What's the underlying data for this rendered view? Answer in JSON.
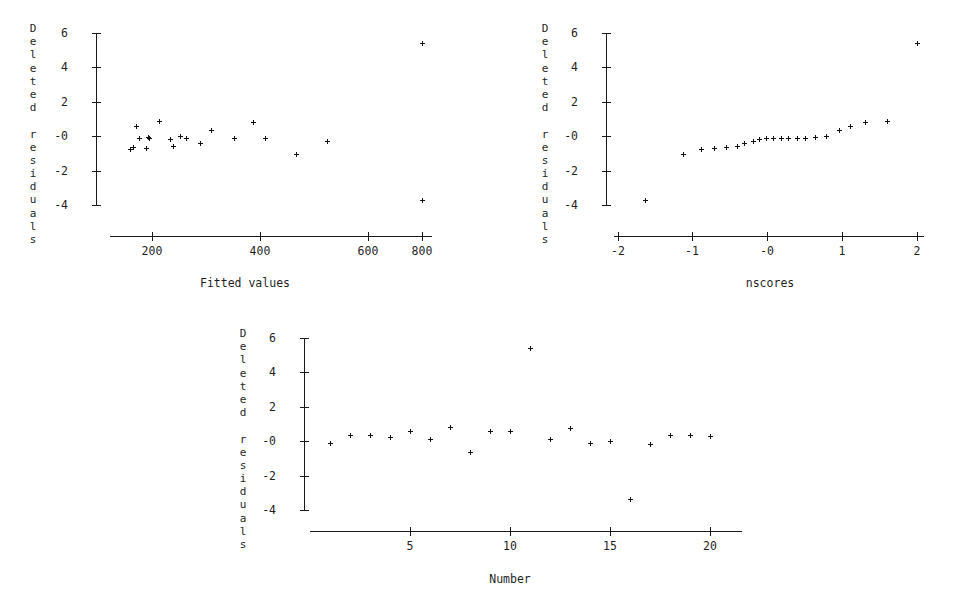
{
  "figure": {
    "y_axis_title": "Deleted residuals",
    "y_axis_title_chars": [
      "D",
      "e",
      "l",
      "e",
      "t",
      "e",
      "d",
      "",
      "r",
      "e",
      "s",
      "i",
      "d",
      "u",
      "a",
      "l",
      "s"
    ],
    "y_tick_labels": [
      "6",
      "4",
      "2",
      "-0",
      "-2",
      "-4"
    ],
    "y_tick_values": [
      6,
      4,
      2,
      0,
      -2,
      -4
    ],
    "marker": "point-marker",
    "n_observations": 20
  },
  "chart_data": [
    {
      "id": "residuals-vs-fitted",
      "type": "scatter",
      "title": "",
      "xlabel": "Fitted values",
      "ylabel": "Deleted residuals",
      "xlim": [
        130,
        830
      ],
      "ylim": [
        -4.6,
        6.4
      ],
      "xticks": [
        200,
        400,
        600,
        800
      ],
      "xtick_labels": [
        "200",
        "400",
        "600",
        "800"
      ],
      "yticks": [
        6,
        4,
        2,
        0,
        -2,
        -4
      ],
      "ytick_labels": [
        "6",
        "4",
        "2",
        "-0",
        "-2",
        "-4"
      ],
      "grid": false,
      "legend": "none",
      "x": [
        152,
        158,
        164,
        170,
        186,
        190,
        193,
        215,
        240,
        247,
        262,
        276,
        306,
        330,
        382,
        424,
        443,
        452,
        519,
        588,
        800,
        801
      ],
      "y": [
        -0.72,
        -0.65,
        0.62,
        -0.09,
        -0.71,
        -0.07,
        -0.12,
        0.9,
        -0.14,
        -0.55,
        0.04,
        -0.11,
        -0.37,
        0.35,
        -0.09,
        0.83,
        -0.08,
        -0.08,
        -1.05,
        -0.26,
        5.4,
        -3.7
      ],
      "points": [
        {
          "x": 152,
          "y": -0.72
        },
        {
          "x": 158,
          "y": -0.65
        },
        {
          "x": 164,
          "y": 0.62
        },
        {
          "x": 170,
          "y": -0.09
        },
        {
          "x": 186,
          "y": -0.71
        },
        {
          "x": 190,
          "y": -0.07
        },
        {
          "x": 193,
          "y": -0.12
        },
        {
          "x": 215,
          "y": 0.9
        },
        {
          "x": 240,
          "y": -0.14
        },
        {
          "x": 247,
          "y": -0.55
        },
        {
          "x": 262,
          "y": 0.04
        },
        {
          "x": 276,
          "y": -0.11
        },
        {
          "x": 306,
          "y": -0.37
        },
        {
          "x": 330,
          "y": 0.35
        },
        {
          "x": 382,
          "y": -0.09
        },
        {
          "x": 424,
          "y": 0.83
        },
        {
          "x": 452,
          "y": -0.08
        },
        {
          "x": 519,
          "y": -1.05
        },
        {
          "x": 588,
          "y": -0.26
        },
        {
          "x": 800,
          "y": 5.4
        },
        {
          "x": 801,
          "y": -3.7
        }
      ]
    },
    {
      "id": "residuals-vs-nscores",
      "type": "scatter",
      "title": "",
      "xlabel": "nscores",
      "ylabel": "Deleted residuals",
      "xlim": [
        -2.25,
        2.3
      ],
      "ylim": [
        -4.6,
        6.4
      ],
      "xticks": [
        -2,
        -1,
        0,
        1,
        2
      ],
      "xtick_labels": [
        "-2",
        "-1",
        "-0",
        "1",
        "2"
      ],
      "yticks": [
        6,
        4,
        2,
        0,
        -2,
        -4
      ],
      "ytick_labels": [
        "6",
        "4",
        "2",
        "-0",
        "-2",
        "-4"
      ],
      "grid": false,
      "legend": "none",
      "x": [
        -1.64,
        -1.13,
        -0.89,
        -0.71,
        -0.55,
        -0.41,
        -0.31,
        -0.2,
        -0.11,
        -0.02,
        0.08,
        0.18,
        0.28,
        0.39,
        0.5,
        0.63,
        0.78,
        0.95,
        1.1,
        1.3,
        1.6,
        2.0
      ],
      "y": [
        -3.7,
        -1.05,
        -0.72,
        -0.71,
        -0.65,
        -0.55,
        -0.37,
        -0.26,
        -0.14,
        -0.12,
        -0.11,
        -0.09,
        -0.09,
        -0.08,
        -0.08,
        -0.07,
        0.04,
        0.35,
        0.62,
        0.83,
        0.9,
        5.4
      ],
      "points": [
        {
          "x": -1.64,
          "y": -3.7
        },
        {
          "x": -1.13,
          "y": -1.05
        },
        {
          "x": -0.89,
          "y": -0.72
        },
        {
          "x": -0.71,
          "y": -0.71
        },
        {
          "x": -0.55,
          "y": -0.65
        },
        {
          "x": -0.41,
          "y": -0.55
        },
        {
          "x": -0.31,
          "y": -0.37
        },
        {
          "x": -0.2,
          "y": -0.26
        },
        {
          "x": -0.11,
          "y": -0.14
        },
        {
          "x": -0.02,
          "y": -0.12
        },
        {
          "x": 0.08,
          "y": -0.11
        },
        {
          "x": 0.18,
          "y": -0.09
        },
        {
          "x": 0.28,
          "y": -0.09
        },
        {
          "x": 0.39,
          "y": -0.08
        },
        {
          "x": 0.5,
          "y": -0.08
        },
        {
          "x": 0.63,
          "y": -0.07
        },
        {
          "x": 0.78,
          "y": 0.04
        },
        {
          "x": 0.95,
          "y": 0.35
        },
        {
          "x": 1.1,
          "y": 0.62
        },
        {
          "x": 1.3,
          "y": 0.83
        },
        {
          "x": 1.6,
          "y": 0.9
        },
        {
          "x": 2.0,
          "y": 5.4
        }
      ]
    },
    {
      "id": "residuals-vs-number",
      "type": "scatter",
      "title": "",
      "xlabel": "Number",
      "ylabel": "Deleted residuals",
      "xlim": [
        0.3,
        21.2
      ],
      "ylim": [
        -4.6,
        6.4
      ],
      "xticks": [
        5,
        10,
        15,
        20
      ],
      "xtick_labels": [
        "5",
        "10",
        "15",
        "20"
      ],
      "yticks": [
        6,
        4,
        2,
        0,
        -2,
        -4
      ],
      "ytick_labels": [
        "6",
        "4",
        "2",
        "-0",
        "-2",
        "-4"
      ],
      "grid": false,
      "legend": "none",
      "x": [
        1,
        2,
        3,
        4,
        5,
        6,
        7,
        8,
        9,
        10,
        11,
        12,
        13,
        14,
        15,
        16,
        17,
        18,
        19,
        20
      ],
      "y": [
        -0.09,
        0.35,
        0.35,
        0.26,
        0.62,
        0.13,
        0.83,
        -0.65,
        -3.7,
        0.62,
        5.4,
        0.13,
        0.78,
        -0.09,
        0.04,
        -3.35,
        -0.14,
        0.35,
        0.35,
        0.3
      ],
      "points": [
        {
          "x": 1,
          "y": -0.09
        },
        {
          "x": 2,
          "y": 0.35
        },
        {
          "x": 3,
          "y": 0.35
        },
        {
          "x": 4,
          "y": 0.26
        },
        {
          "x": 5,
          "y": 0.62
        },
        {
          "x": 6,
          "y": 0.13
        },
        {
          "x": 7,
          "y": 0.83
        },
        {
          "x": 8,
          "y": -0.65
        },
        {
          "x": 9,
          "y": 0.62
        },
        {
          "x": 10,
          "y": 0.62
        },
        {
          "x": 11,
          "y": 5.4
        },
        {
          "x": 12,
          "y": 0.13
        },
        {
          "x": 13,
          "y": 0.78
        },
        {
          "x": 14,
          "y": -0.09
        },
        {
          "x": 15,
          "y": 0.04
        },
        {
          "x": 16,
          "y": -3.35
        },
        {
          "x": 17,
          "y": -0.14
        },
        {
          "x": 18,
          "y": 0.35
        },
        {
          "x": 19,
          "y": 0.35
        },
        {
          "x": 20,
          "y": 0.3
        }
      ]
    }
  ]
}
